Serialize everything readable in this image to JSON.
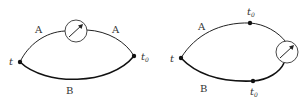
{
  "left_diagram": {
    "start_label": "t",
    "end_label": "t",
    "end_sub": "0",
    "upper_path_label_left": "A",
    "upper_path_label_right": "A",
    "lower_path_label": "B",
    "meter_icon": "clock-meter-icon"
  },
  "right_diagram": {
    "start_label": "t",
    "upper_node_label": "t",
    "upper_node_sub": "0",
    "lower_node_label": "t",
    "lower_node_sub": "0",
    "upper_path_label": "A",
    "lower_path_label": "B",
    "meter_icon": "clock-meter-icon"
  },
  "colors": {
    "line": "#111111",
    "text": "#333333"
  }
}
